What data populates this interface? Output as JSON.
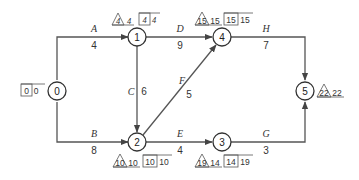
{
  "diagram": {
    "type": "activity-on-arrow network",
    "nodes": [
      {
        "id": "0",
        "label": "0",
        "x": 54,
        "y": 91,
        "box": [
          "0",
          "0"
        ],
        "tri": null
      },
      {
        "id": "1",
        "label": "1",
        "x": 137,
        "y": 37,
        "tri": [
          "4",
          "4"
        ],
        "box": [
          "4",
          "4"
        ]
      },
      {
        "id": "2",
        "label": "2",
        "x": 137,
        "y": 142,
        "tri": [
          "10",
          "10"
        ],
        "box": [
          "10",
          "10"
        ]
      },
      {
        "id": "3",
        "label": "3",
        "x": 222,
        "y": 142,
        "tri": [
          "19",
          "14"
        ],
        "box": [
          "14",
          "19"
        ]
      },
      {
        "id": "4",
        "label": "4",
        "x": 222,
        "y": 37,
        "tri": [
          "15",
          "15"
        ],
        "box": [
          "15",
          "15"
        ]
      },
      {
        "id": "5",
        "label": "5",
        "x": 305,
        "y": 91,
        "tri": [
          "22",
          "22"
        ],
        "box": null
      }
    ],
    "activities": [
      {
        "name": "A",
        "duration": "4",
        "from": "0",
        "to": "1"
      },
      {
        "name": "B",
        "duration": "8",
        "from": "0",
        "to": "2"
      },
      {
        "name": "C",
        "duration": "6",
        "from": "1",
        "to": "2"
      },
      {
        "name": "D",
        "duration": "9",
        "from": "1",
        "to": "4"
      },
      {
        "name": "E",
        "duration": "4",
        "from": "2",
        "to": "3"
      },
      {
        "name": "F",
        "duration": "5",
        "from": "2",
        "to": "4"
      },
      {
        "name": "G",
        "duration": "3",
        "from": "3",
        "to": "5"
      },
      {
        "name": "H",
        "duration": "7",
        "from": "4",
        "to": "5"
      }
    ]
  },
  "labels": {
    "n0": {
      "num": "0",
      "box_a": "0",
      "box_b": "0"
    },
    "n1": {
      "num": "1",
      "tri_a": "4",
      "tri_b": "4",
      "box_a": "4",
      "box_b": "4"
    },
    "n2": {
      "num": "2",
      "tri_a": "10",
      "tri_b": "10",
      "box_a": "10",
      "box_b": "10"
    },
    "n3": {
      "num": "3",
      "tri_a": "19",
      "tri_b": "14",
      "box_a": "14",
      "box_b": "19"
    },
    "n4": {
      "num": "4",
      "tri_a": "15",
      "tri_b": "15",
      "box_a": "15",
      "box_b": "15"
    },
    "n5": {
      "num": "5",
      "tri_a": "22",
      "tri_b": "22"
    },
    "A": {
      "name": "A",
      "dur": "4"
    },
    "B": {
      "name": "B",
      "dur": "8"
    },
    "C": {
      "name": "C",
      "dur": "6"
    },
    "D": {
      "name": "D",
      "dur": "9"
    },
    "E": {
      "name": "E",
      "dur": "4"
    },
    "F": {
      "name": "F",
      "dur": "5"
    },
    "G": {
      "name": "G",
      "dur": "3"
    },
    "H": {
      "name": "H",
      "dur": "7"
    }
  }
}
